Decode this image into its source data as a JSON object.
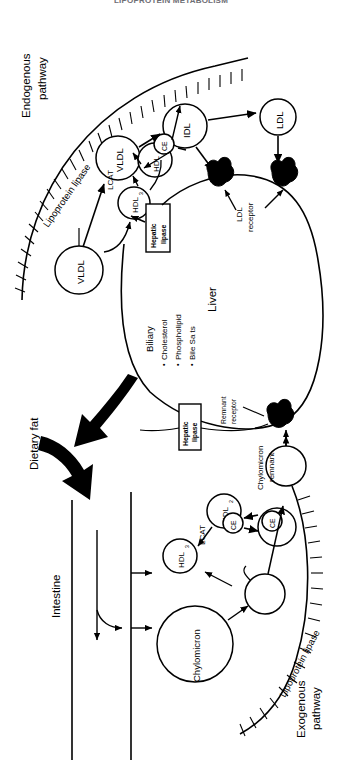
{
  "header": {
    "running_title": "LIPOPROTEIN METABOLISM"
  },
  "figure": {
    "orientation": "rotated-90-ccw",
    "pathways": {
      "endogenous_label_line1": "Endogenous",
      "endogenous_label_line2": "pathway",
      "exogenous_label_line1": "Exogenous",
      "exogenous_label_line2": "pathway"
    },
    "enzymes": {
      "lipoprotein_lipase_top": "Lipoprotein lipase",
      "lipoprotein_lipase_bottom": "Lipoprotein lipase",
      "lcat_top": "LCAT",
      "lcat_bottom": "LCAT",
      "hepatic_lipase_top_line1": "Hepatic",
      "hepatic_lipase_top_line2": "lipase",
      "hepatic_lipase_bottom_line1": "Hepatic",
      "hepatic_lipase_bottom_line2": "lipase"
    },
    "particles": {
      "vldl_source": "VLDL",
      "vldl_remodeled": "VLDL",
      "idl": "IDL",
      "ldl": "LDL",
      "hdl3_top": "HDL",
      "hdl3_top_sub": "3",
      "hdl2_top": "HDL",
      "hdl2_top_sub": "2",
      "ce_top_a": "CE",
      "ce_top_b": "CE",
      "hdl3_bottom": "HDL",
      "hdl3_bottom_sub": "3",
      "hdl2_bottom": "HDL",
      "hdl2_bottom_sub": "2",
      "ce_bottom_a": "CE",
      "ce_bottom_b": "CE",
      "chylomicron": "Chylomicron",
      "chylomicron_remnant_line1": "Chylomicron",
      "chylomicron_remnant_line2": "remnant"
    },
    "receptors": {
      "ldl_receptor_line1": "LDL",
      "ldl_receptor_line2": "receptor",
      "remnant_receptor_line1": "Remnant",
      "remnant_receptor_line2": "receptor"
    },
    "organs": {
      "liver": "Liver",
      "intestine": "Intestine"
    },
    "biliary": {
      "title": "Biliary",
      "items": [
        "Cholesterol",
        "Phospholipid",
        "Bile Sa ts"
      ],
      "bullet": "•"
    },
    "inputs": {
      "dietary_fat": "Dietary fat"
    },
    "colors": {
      "ink": "#000000",
      "background": "#ffffff",
      "header_text": "#6e6e74"
    }
  }
}
